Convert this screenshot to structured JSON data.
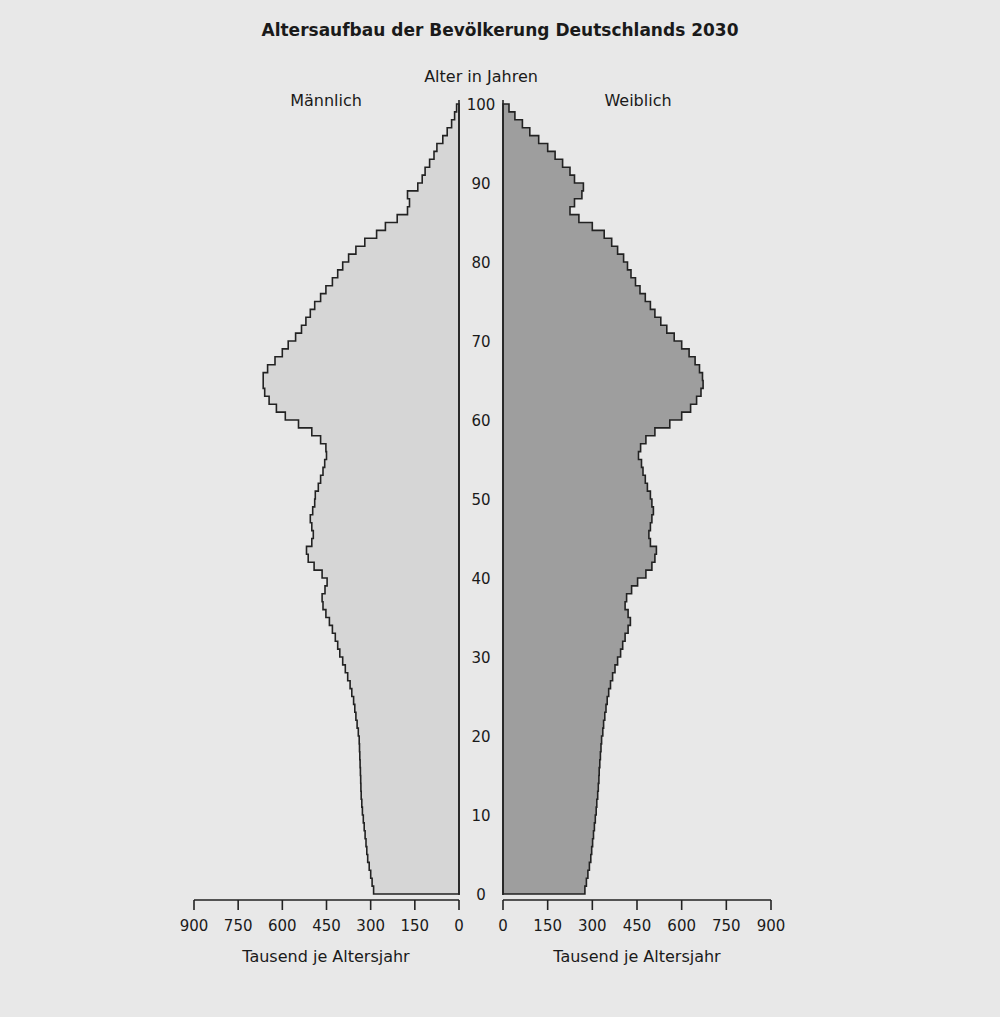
{
  "chart_data": {
    "type": "bar",
    "subtype": "population-pyramid",
    "title": "Altersaufbau der Bevölkerung Deutschlands 2030",
    "ylabel": "Alter in Jahren",
    "xlabel_left": "Tausend je Altersjahr",
    "xlabel_right": "Tausend je Altersjahr",
    "legend": {
      "left": "Männlich",
      "right": "Weiblich"
    },
    "x_ticks": [
      0,
      150,
      300,
      450,
      600,
      750,
      900
    ],
    "y_ticks": [
      0,
      10,
      20,
      30,
      40,
      50,
      60,
      70,
      80,
      90,
      100
    ],
    "xlim": [
      0,
      900
    ],
    "ylim": [
      0,
      100
    ],
    "colors": {
      "background": "#e8e8e8",
      "male": "#d6d6d6",
      "female": "#9e9e9e",
      "outline": "#222222"
    },
    "ages": [
      0,
      1,
      2,
      3,
      4,
      5,
      6,
      7,
      8,
      9,
      10,
      11,
      12,
      13,
      14,
      15,
      16,
      17,
      18,
      19,
      20,
      21,
      22,
      23,
      24,
      25,
      26,
      27,
      28,
      29,
      30,
      31,
      32,
      33,
      34,
      35,
      36,
      37,
      38,
      39,
      40,
      41,
      42,
      43,
      44,
      45,
      46,
      47,
      48,
      49,
      50,
      51,
      52,
      53,
      54,
      55,
      56,
      57,
      58,
      59,
      60,
      61,
      62,
      63,
      64,
      65,
      66,
      67,
      68,
      69,
      70,
      71,
      72,
      73,
      74,
      75,
      76,
      77,
      78,
      79,
      80,
      81,
      82,
      83,
      84,
      85,
      86,
      87,
      88,
      89,
      90,
      91,
      92,
      93,
      94,
      95,
      96,
      97,
      98,
      99
    ],
    "series": [
      {
        "name": "Männlich",
        "values": [
          290,
          295,
          300,
          305,
          310,
          313,
          316,
          319,
          322,
          325,
          328,
          330,
          332,
          333,
          334,
          335,
          336,
          337,
          338,
          339,
          342,
          346,
          350,
          354,
          358,
          364,
          370,
          378,
          386,
          395,
          405,
          412,
          420,
          430,
          440,
          452,
          462,
          465,
          455,
          448,
          465,
          492,
          512,
          518,
          500,
          495,
          500,
          505,
          497,
          490,
          488,
          478,
          470,
          462,
          456,
          450,
          452,
          470,
          500,
          545,
          590,
          620,
          645,
          660,
          665,
          665,
          650,
          625,
          600,
          580,
          555,
          535,
          520,
          505,
          490,
          470,
          452,
          430,
          412,
          395,
          375,
          350,
          320,
          280,
          250,
          210,
          175,
          168,
          175,
          140,
          125,
          115,
          100,
          85,
          75,
          55,
          40,
          25,
          15,
          8
        ]
      },
      {
        "name": "Weiblich",
        "values": [
          275,
          280,
          285,
          290,
          295,
          298,
          301,
          304,
          307,
          310,
          313,
          315,
          318,
          320,
          322,
          323,
          325,
          327,
          329,
          331,
          335,
          338,
          342,
          346,
          350,
          355,
          361,
          368,
          376,
          385,
          395,
          402,
          410,
          420,
          428,
          420,
          410,
          415,
          432,
          452,
          480,
          500,
          510,
          515,
          495,
          490,
          495,
          500,
          505,
          500,
          495,
          485,
          478,
          470,
          465,
          455,
          462,
          480,
          510,
          560,
          600,
          630,
          650,
          665,
          672,
          670,
          660,
          645,
          625,
          600,
          575,
          550,
          530,
          510,
          495,
          478,
          460,
          445,
          430,
          418,
          405,
          385,
          365,
          340,
          300,
          255,
          225,
          240,
          265,
          270,
          240,
          225,
          200,
          175,
          150,
          120,
          90,
          65,
          40,
          20
        ]
      }
    ]
  }
}
